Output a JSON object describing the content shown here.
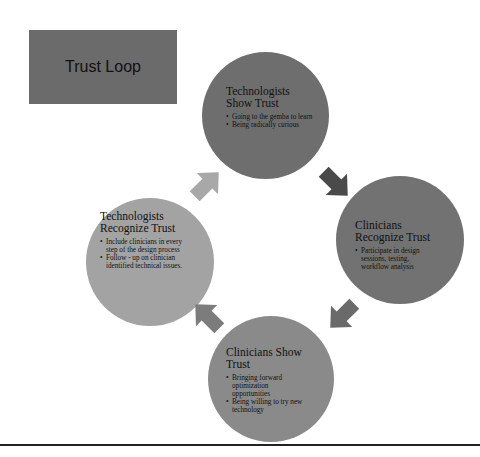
{
  "diagram": {
    "title": "Trust Loop",
    "type": "cycle",
    "nodes": [
      {
        "id": "tech-show",
        "heading": "Technologists Show Trust",
        "heading_line1": "Technologists",
        "heading_line2": "Show Trust",
        "bullets": [
          "Going to the gemba to learn",
          "Being radically curious"
        ],
        "fill": "#6e6e6e"
      },
      {
        "id": "clin-recognize",
        "heading": "Clinicians Recognize Trust",
        "heading_line1": "Clinicians",
        "heading_line2": "Recognize Trust",
        "bullets": [
          "Participate in design sessions, testing, workflow analysis"
        ],
        "fill": "#727272"
      },
      {
        "id": "clin-show",
        "heading": "Clinicians Show Trust",
        "heading_line1": "Clinicians Show",
        "heading_line2": "Trust",
        "bullets": [
          "Bringing forward optimization opportunities",
          "Being willing to try new technology"
        ],
        "fill": "#8a8a8a"
      },
      {
        "id": "tech-recognize",
        "heading": "Technologists Recognize Trust",
        "heading_line1": "Technologists",
        "heading_line2": "Recognize Trust",
        "bullets": [
          "Include clinicians in every step of the design process",
          "Follow - up on clinician identified technical issues."
        ],
        "fill": "#a3a3a3"
      }
    ],
    "edges": [
      {
        "from": "tech-show",
        "to": "clin-recognize",
        "color": "#4a4a4a"
      },
      {
        "from": "clin-recognize",
        "to": "clin-show",
        "color": "#6a6a6a"
      },
      {
        "from": "clin-show",
        "to": "tech-recognize",
        "color": "#7c7c7c"
      },
      {
        "from": "tech-recognize",
        "to": "tech-show",
        "color": "#a8a8a8"
      }
    ]
  },
  "colors": {
    "title_box": "#6b6b6b",
    "background": "#ffffff",
    "bottom_rule": "#222222"
  }
}
